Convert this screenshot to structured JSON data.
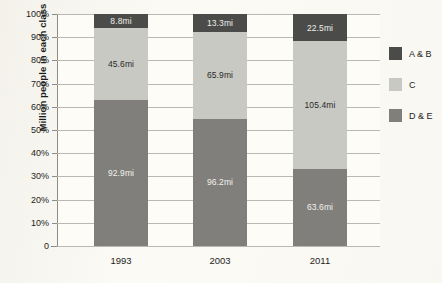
{
  "chart_data": {
    "type": "bar",
    "stacked": true,
    "normalized": "100%",
    "title": "",
    "xlabel": "",
    "ylabel": "Million people in each class",
    "categories": [
      "1993",
      "2003",
      "2011"
    ],
    "ytick_labels": [
      "100%",
      "90%",
      "80%",
      "70%",
      "60%",
      "50%",
      "40%",
      "30%",
      "20%",
      "10%",
      "0"
    ],
    "ylim": [
      0,
      100
    ],
    "grid": true,
    "legend_position": "right",
    "series": [
      {
        "name": "A & B",
        "color": "#4b4b49",
        "values": [
          8.8,
          13.3,
          22.5
        ],
        "labels": [
          "8.8mi",
          "13.3mi",
          "22.5mi"
        ],
        "percents": [
          6.0,
          7.6,
          11.8
        ]
      },
      {
        "name": "C",
        "color": "#c9c9c4",
        "values": [
          45.6,
          65.9,
          105.4
        ],
        "labels": [
          "45.6mi",
          "65.9mi",
          "105.4mi"
        ],
        "percents": [
          31.1,
          37.6,
          55.0
        ]
      },
      {
        "name": "D & E",
        "color": "#807f7b",
        "values": [
          92.9,
          96.2,
          63.6
        ],
        "labels": [
          "92.9mi",
          "96.2mi",
          "63.6mi"
        ],
        "percents": [
          62.9,
          54.8,
          33.2
        ]
      }
    ]
  },
  "legend": {
    "items": [
      {
        "label": "A & B",
        "color": "#4b4b49"
      },
      {
        "label": "C",
        "color": "#c9c9c4"
      },
      {
        "label": "D & E",
        "color": "#807f7b"
      }
    ]
  }
}
